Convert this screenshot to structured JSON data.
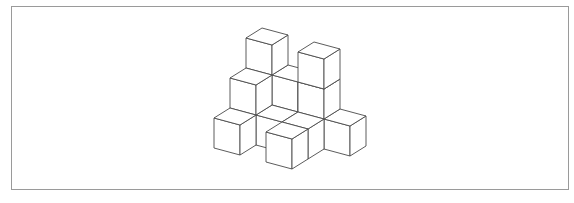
{
  "figure": {
    "stroke_color": "#4a4a4a",
    "frame_color": "#9a9a9a",
    "geometry": {
      "origin": [
        214,
        118
      ],
      "x_vec": [
        26,
        7
      ],
      "y_vec": [
        16,
        -10
      ],
      "z_height": 30
    },
    "cubes": [
      {
        "x": 0,
        "y": 2,
        "z": 0
      },
      {
        "x": 1,
        "y": 2,
        "z": 0
      },
      {
        "x": 2,
        "y": 2,
        "z": 0
      },
      {
        "x": 0,
        "y": 2,
        "z": 1
      },
      {
        "x": 1,
        "y": 2,
        "z": 1
      },
      {
        "x": 2,
        "y": 2,
        "z": 1
      },
      {
        "x": 0,
        "y": 1,
        "z": 0
      },
      {
        "x": 2,
        "y": 1,
        "z": 0
      },
      {
        "x": 0,
        "y": 2,
        "z": 2
      },
      {
        "x": 2,
        "y": 2,
        "z": 2
      },
      {
        "x": 0,
        "y": 1,
        "z": 1
      },
      {
        "x": 1,
        "y": 1,
        "z": 0
      },
      {
        "x": 3,
        "y": 2,
        "z": 0
      },
      {
        "x": 0,
        "y": 0,
        "z": 0
      },
      {
        "x": 2,
        "y": 0,
        "z": 0
      }
    ]
  }
}
